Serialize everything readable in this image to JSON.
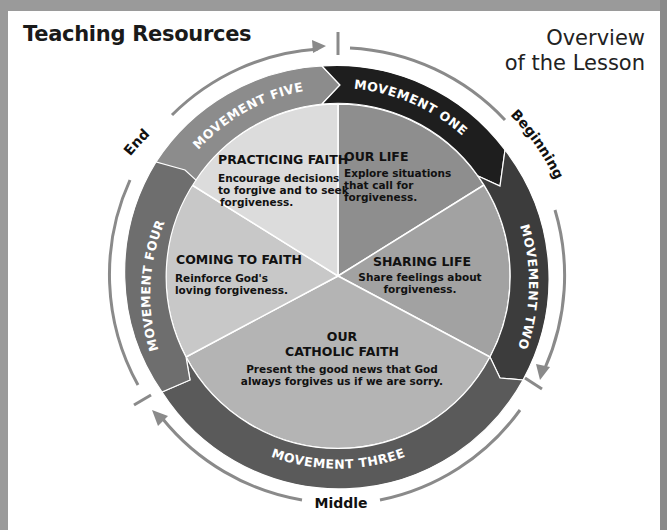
{
  "header": {
    "title": "Teaching Resources",
    "overview_line1": "Overview",
    "overview_line2": "of the Lesson"
  },
  "phases": {
    "beginning": "Beginning",
    "middle": "Middle",
    "end": "End"
  },
  "movements": [
    {
      "label": "MOVEMENT ONE",
      "color": "#1e1e1e"
    },
    {
      "label": "MOVEMENT TWO",
      "color": "#3c3c3c"
    },
    {
      "label": "MOVEMENT THREE",
      "color": "#5a5a5a"
    },
    {
      "label": "MOVEMENT FOUR",
      "color": "#6e6e6e"
    },
    {
      "label": "MOVEMENT FIVE",
      "color": "#8c8c8c"
    }
  ],
  "segments": [
    {
      "title": "OUR LIFE",
      "lines": [
        "Explore situations",
        "that call for",
        "forgiveness."
      ],
      "color": "#8e8e8e"
    },
    {
      "title": "SHARING LIFE",
      "lines": [
        "Share feelings about",
        "forgiveness."
      ],
      "color": "#a2a2a2"
    },
    {
      "title_line1": "OUR",
      "title_line2": "CATHOLIC FAITH",
      "lines": [
        "Present the good news that God",
        "always forgives us if we are sorry."
      ],
      "color": "#b4b4b4"
    },
    {
      "title": "COMING TO FAITH",
      "lines": [
        "Reinforce God's",
        "loving forgiveness."
      ],
      "color": "#c8c8c8"
    },
    {
      "title": "PRACTICING FAITH",
      "lines": [
        "Encourage decisions",
        "to forgive and to seek",
        "forgiveness."
      ],
      "color": "#dcdcdc"
    }
  ]
}
